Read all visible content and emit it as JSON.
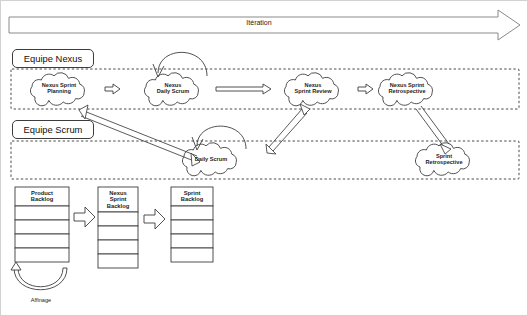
{
  "diagram": {
    "language": "fr",
    "background": "#ffffff",
    "line_color": "#3d3d3d",
    "text_color": "#1c1c1c"
  },
  "iteration_bar": {
    "label": "Itération",
    "shape": "block-arrow-right"
  },
  "teams": [
    {
      "id": "nexus",
      "label": "Equipe Nexus"
    },
    {
      "id": "scrum",
      "label": "Equipe Scrum"
    }
  ],
  "nexus_row": {
    "events": [
      {
        "id": "nexus-sprint-planning",
        "line1": "Nexus Sprint",
        "line2": "Planning"
      },
      {
        "id": "nexus-daily-scrum",
        "line1": "Nexus",
        "line2": "Daily Scrum"
      },
      {
        "id": "nexus-sprint-review",
        "line1": "Nexus",
        "line2": "Sprint Review"
      },
      {
        "id": "nexus-sprint-retrospective",
        "line1": "Nexus Sprint",
        "line2": "Retrospective"
      }
    ]
  },
  "scrum_row": {
    "events": [
      {
        "id": "daily-scrum",
        "line1": "Daily Scrum",
        "line2": ""
      },
      {
        "id": "sprint-retrospective",
        "line1": "Sprint",
        "line2": "Retrospective"
      }
    ]
  },
  "backlogs": [
    {
      "id": "product-backlog",
      "line1": "Product",
      "line2": "Backlog",
      "line3": "",
      "rows": 4
    },
    {
      "id": "nexus-sprint-backlog",
      "line1": "Nexus",
      "line2": "Sprint",
      "line3": "Backlog",
      "rows": 4
    },
    {
      "id": "sprint-backlog",
      "line1": "Sprint",
      "line2": "Backlog",
      "line3": "",
      "rows": 4
    }
  ],
  "refinement": {
    "label": "Affinage"
  }
}
